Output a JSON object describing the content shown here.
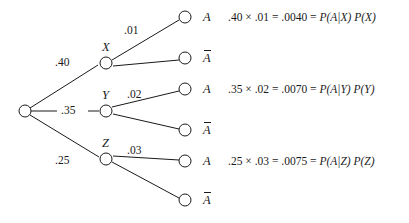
{
  "diagram": {
    "type": "probability-tree",
    "title": "",
    "root": {
      "name": "root-node",
      "label": ""
    },
    "branches": [
      {
        "id": "X",
        "node_label": "X",
        "prior_label": ".40",
        "prior_value": 0.4,
        "conditional_label": ".01",
        "conditional_value": 0.01,
        "outcomes": [
          {
            "label": "A",
            "complement": false
          },
          {
            "label": "A",
            "complement": true
          }
        ],
        "equation": {
          "prior": ".40",
          "operator": "×",
          "conditional": ".01",
          "equals1": "=",
          "product": ".0040",
          "equals2": "=",
          "expr_cond": "P(A|X)",
          "expr_prior": "P(X)",
          "full": ".40 × .01 = .0040 = P(A|X) P(X)"
        }
      },
      {
        "id": "Y",
        "node_label": "Y",
        "prior_label": ".35",
        "prior_value": 0.35,
        "conditional_label": ".02",
        "conditional_value": 0.02,
        "outcomes": [
          {
            "label": "A",
            "complement": false
          },
          {
            "label": "A",
            "complement": true
          }
        ],
        "equation": {
          "prior": ".35",
          "operator": "×",
          "conditional": ".02",
          "equals1": "=",
          "product": ".0070",
          "equals2": "=",
          "expr_cond": "P(A|Y)",
          "expr_prior": "P(Y)",
          "full": ".35 × .02 = .0070 = P(A|Y) P(Y)"
        }
      },
      {
        "id": "Z",
        "node_label": "Z",
        "prior_label": ".25",
        "prior_value": 0.25,
        "conditional_label": ".03",
        "conditional_value": 0.03,
        "outcomes": [
          {
            "label": "A",
            "complement": false
          },
          {
            "label": "A",
            "complement": true
          }
        ],
        "equation": {
          "prior": ".25",
          "operator": "×",
          "conditional": ".03",
          "equals1": "=",
          "product": ".0075",
          "equals2": "=",
          "expr_cond": "P(A|Z)",
          "expr_prior": "P(Z)",
          "full": ".25 × .03 = .0075 = P(A|Z) P(Z)"
        }
      }
    ],
    "colors": {
      "ink": "#1a1a1a",
      "background": "#ffffff"
    }
  }
}
